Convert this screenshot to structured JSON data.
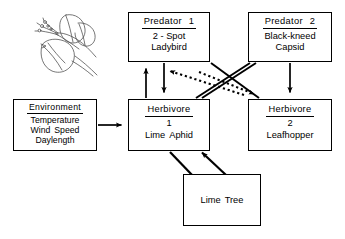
{
  "diagram": {
    "background_color": "#ffffff",
    "line_color": "#000000",
    "nodes": {
      "predator1": {
        "header": "Predator",
        "header_number": "1",
        "line2": "2 - Spot",
        "line3": "Ladybird"
      },
      "predator2": {
        "header": "Predator",
        "header_number": "2",
        "line2": "Black-kneed",
        "line3": "Capsid"
      },
      "environment": {
        "header": "Environment",
        "line2": "Temperature",
        "line3a": "Wind",
        "line3b": "Speed",
        "line4": "Daylength"
      },
      "herbivore1": {
        "header": "Herbivore",
        "number": "1",
        "species_a": "Lime",
        "species_b": "Aphid"
      },
      "herbivore2": {
        "header": "Herbivore",
        "number": "2",
        "species": "Leafhopper"
      },
      "limetree": {
        "label_a": "Lime",
        "label_b": "Tree"
      }
    },
    "sketch": {
      "name": "lime-tree-branch-sketch",
      "description": "Line drawing of a lime (linden) branch with leaves, bract and flowers"
    },
    "edges": [
      {
        "name": "environment-to-herbivore1",
        "from": "environment",
        "to": "herbivore1",
        "style": "solid",
        "arrow": "end"
      },
      {
        "name": "herbivore1-to-predator1",
        "from": "herbivore1",
        "to": "predator1",
        "style": "solid",
        "arrow": "end"
      },
      {
        "name": "predator1-to-herbivore1",
        "from": "predator1",
        "to": "herbivore1",
        "style": "solid",
        "arrow": "end"
      },
      {
        "name": "predator2-to-herbivore2",
        "from": "predator2",
        "to": "herbivore2",
        "style": "solid",
        "arrow": "end"
      },
      {
        "name": "herbivore2-to-predator1",
        "from": "herbivore2",
        "to": "predator1",
        "style": "solid",
        "arrow": "none"
      },
      {
        "name": "herbivore1-to-predator2",
        "from": "herbivore1",
        "to": "predator2",
        "style": "solid",
        "arrow": "none"
      },
      {
        "name": "herbivore2-to-predator1-feedback",
        "from": "herbivore2",
        "to": "predator1",
        "style": "dotted",
        "arrow": "end"
      },
      {
        "name": "predator1-to-herbivore2-feedback",
        "from": "predator1",
        "to": "herbivore2",
        "style": "dotted",
        "arrow": "end"
      },
      {
        "name": "herbivore1-to-limetree",
        "from": "herbivore1",
        "to": "limetree",
        "style": "solid",
        "arrow": "none"
      },
      {
        "name": "limetree-to-herbivore1",
        "from": "limetree",
        "to": "herbivore1",
        "style": "solid",
        "arrow": "end"
      }
    ]
  }
}
